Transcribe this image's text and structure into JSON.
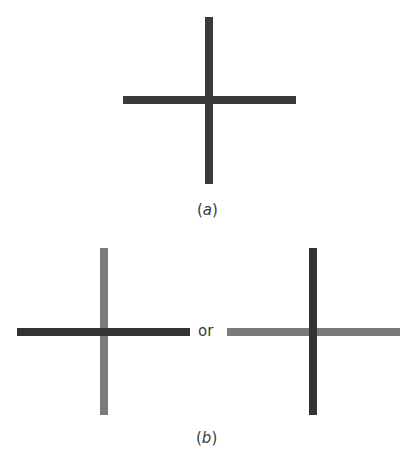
{
  "figure": {
    "panel_a": {
      "label": "(a)",
      "label_letter": "a",
      "cross": {
        "vertical": {
          "x": 205,
          "y": 17,
          "w": 8,
          "h": 167,
          "color": "#3a3a3a"
        },
        "horizontal": {
          "x": 123,
          "y": 96,
          "w": 173,
          "h": 8,
          "color": "#3a3a3a"
        }
      }
    },
    "panel_b": {
      "label": "(b)",
      "label_letter": "b",
      "connector_text": "or",
      "left_cross": {
        "description": "dark horizontal bar over lighter vertical bar",
        "vertical": {
          "x": 100,
          "y": 248,
          "w": 8,
          "h": 167,
          "color": "#7a7a7a"
        },
        "horizontal": {
          "x": 17,
          "y": 328,
          "w": 173,
          "h": 8,
          "color": "#333333"
        }
      },
      "right_cross": {
        "description": "dark vertical bar over lighter horizontal bar",
        "vertical": {
          "x": 309,
          "y": 248,
          "w": 8,
          "h": 167,
          "color": "#333333"
        },
        "horizontal": {
          "x": 227,
          "y": 328,
          "w": 173,
          "h": 8,
          "color": "#7a7a7a"
        }
      }
    },
    "colors": {
      "dark_bar": "#333333",
      "light_bar": "#7a7a7a",
      "text": "#3a3a3a",
      "background": "#ffffff"
    }
  }
}
